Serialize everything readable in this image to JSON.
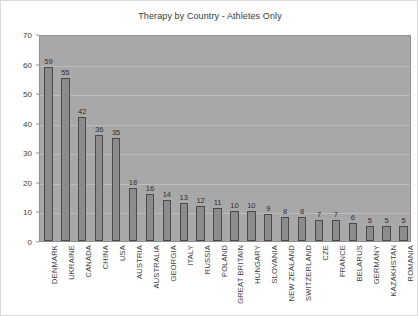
{
  "chart_data": {
    "type": "bar",
    "title": "Therapy by Country - Athletes Only",
    "xlabel": "",
    "ylabel": "",
    "ylim": [
      0,
      70
    ],
    "ytick_step": 10,
    "yticks": [
      0,
      10,
      20,
      30,
      40,
      50,
      60,
      70
    ],
    "grid": true,
    "legend": false,
    "show_value_labels": true,
    "categories": [
      "DENMARK",
      "UKRAINE",
      "CANADA",
      "CHINA",
      "USA",
      "AUSTRIA",
      "AUSTRALIA",
      "GEORGIA",
      "ITALY",
      "RUSSIA",
      "POLAND",
      "GREAT BRITAIN",
      "HUNGARY",
      "SLOVANIA",
      "NEW ZEALAND",
      "SWITZERLAND",
      "CZE",
      "FRANCE",
      "BELARUS",
      "GERMANY",
      "KAZAKHSTAN",
      "ROMANIA"
    ],
    "values": [
      59,
      55,
      42,
      36,
      35,
      18,
      16,
      14,
      13,
      12,
      11,
      10,
      10,
      9,
      8,
      8,
      7,
      7,
      6,
      5,
      5,
      5
    ],
    "colors": {
      "bar_fill": "#8c8c8c",
      "bar_edge": "#4a4a4a",
      "plot_background": "#a8a8a8",
      "figure_background": "#ffffff",
      "gridline": "#bdbdbd",
      "text": "#3c3c3c"
    }
  }
}
